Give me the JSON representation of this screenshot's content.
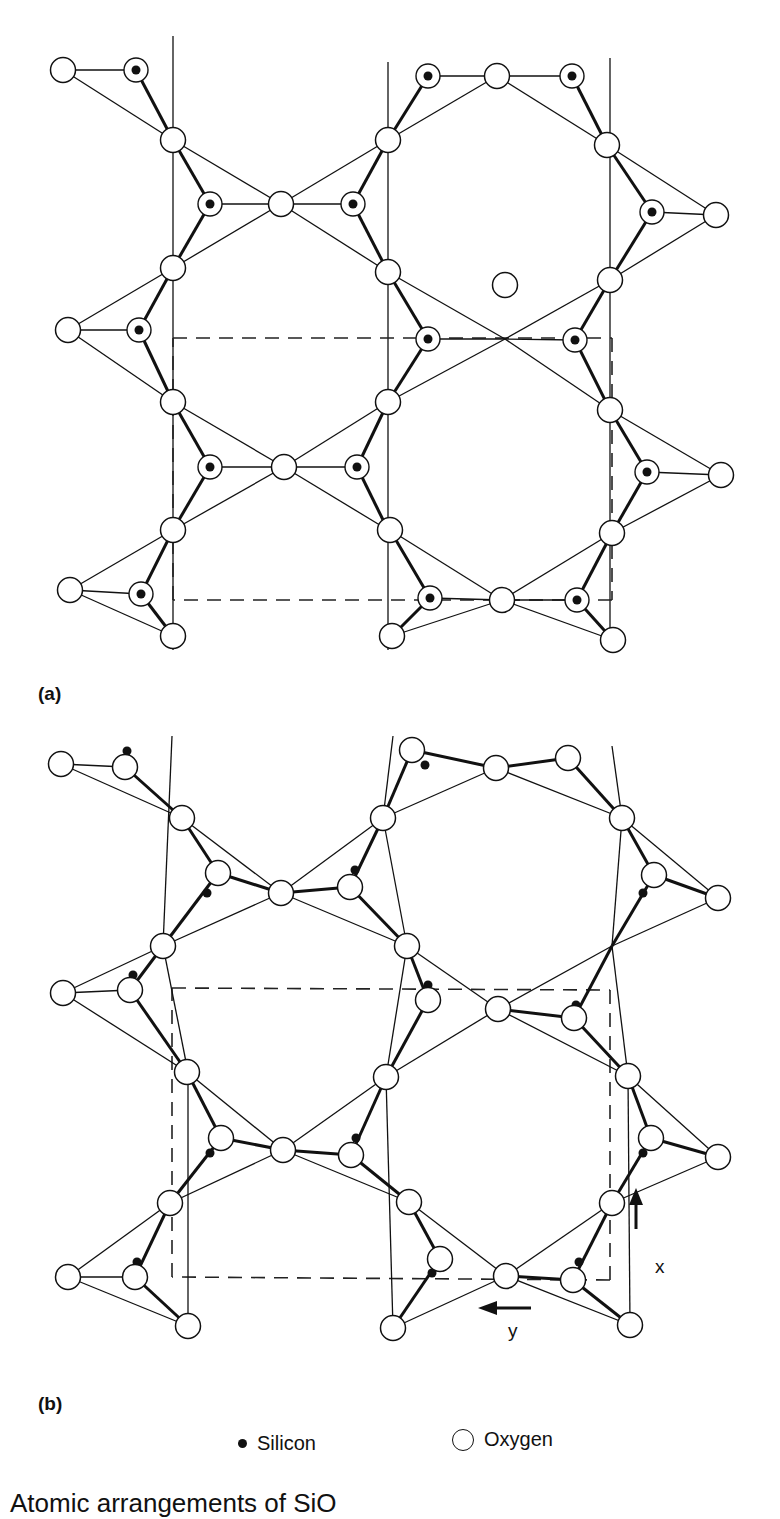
{
  "figure": {
    "panel_a": {
      "label": "(a)",
      "oxygen": [
        [
          63,
          70
        ],
        [
          173,
          140
        ],
        [
          281,
          204
        ],
        [
          173,
          268
        ],
        [
          68,
          330
        ],
        [
          173,
          402
        ],
        [
          284,
          467
        ],
        [
          173,
          530
        ],
        [
          70,
          590
        ],
        [
          173,
          636
        ],
        [
          388,
          140
        ],
        [
          497,
          76
        ],
        [
          607,
          145
        ],
        [
          716,
          215
        ],
        [
          388,
          272
        ],
        [
          505,
          285
        ],
        [
          610,
          280
        ],
        [
          388,
          402
        ],
        [
          610,
          410
        ],
        [
          721,
          475
        ],
        [
          390,
          530
        ],
        [
          502,
          600
        ],
        [
          612,
          533
        ],
        [
          392,
          636
        ],
        [
          613,
          640
        ]
      ],
      "silicon": [
        [
          136,
          70
        ],
        [
          210,
          204
        ],
        [
          353,
          204
        ],
        [
          139,
          330
        ],
        [
          210,
          467
        ],
        [
          357,
          467
        ],
        [
          141,
          594
        ],
        [
          428,
          76
        ],
        [
          572,
          76
        ],
        [
          652,
          212
        ],
        [
          428,
          339
        ],
        [
          575,
          340
        ],
        [
          647,
          472
        ],
        [
          430,
          598
        ],
        [
          577,
          600
        ]
      ],
      "bonds_thin": [
        [
          63,
          70,
          136,
          70
        ],
        [
          63,
          70,
          173,
          140
        ],
        [
          173,
          140,
          281,
          204
        ],
        [
          173,
          268,
          281,
          204
        ],
        [
          281,
          204,
          388,
          140
        ],
        [
          281,
          204,
          388,
          272
        ],
        [
          68,
          330,
          173,
          268
        ],
        [
          68,
          330,
          173,
          402
        ],
        [
          68,
          330,
          139,
          330
        ],
        [
          173,
          402,
          284,
          467
        ],
        [
          173,
          530,
          284,
          467
        ],
        [
          284,
          467,
          388,
          402
        ],
        [
          284,
          467,
          388,
          530
        ],
        [
          70,
          590,
          173,
          530
        ],
        [
          70,
          590,
          173,
          636
        ],
        [
          70,
          590,
          141,
          594
        ],
        [
          388,
          140,
          497,
          76
        ],
        [
          497,
          76,
          607,
          145
        ],
        [
          607,
          145,
          716,
          215
        ],
        [
          716,
          215,
          610,
          280
        ],
        [
          388,
          272,
          505,
          339
        ],
        [
          505,
          339,
          610,
          280
        ],
        [
          388,
          402,
          505,
          339
        ],
        [
          505,
          339,
          610,
          410
        ],
        [
          610,
          410,
          721,
          475
        ],
        [
          721,
          475,
          612,
          533
        ],
        [
          390,
          530,
          502,
          600
        ],
        [
          502,
          600,
          612,
          533
        ],
        [
          392,
          636,
          502,
          600
        ],
        [
          502,
          600,
          613,
          640
        ],
        [
          497,
          76,
          428,
          76
        ],
        [
          497,
          76,
          572,
          76
        ],
        [
          505,
          339,
          428,
          339
        ],
        [
          505,
          339,
          575,
          340
        ],
        [
          502,
          600,
          430,
          598
        ],
        [
          502,
          600,
          577,
          600
        ],
        [
          281,
          204,
          210,
          204
        ],
        [
          281,
          204,
          353,
          204
        ],
        [
          284,
          467,
          210,
          467
        ],
        [
          284,
          467,
          357,
          467
        ],
        [
          716,
          215,
          652,
          212
        ],
        [
          721,
          475,
          647,
          472
        ]
      ],
      "bonds_thick": [
        [
          136,
          70,
          173,
          140
        ],
        [
          210,
          204,
          173,
          140
        ],
        [
          210,
          204,
          173,
          268
        ],
        [
          353,
          204,
          388,
          140
        ],
        [
          353,
          204,
          388,
          272
        ],
        [
          139,
          330,
          173,
          268
        ],
        [
          139,
          330,
          173,
          402
        ],
        [
          210,
          467,
          173,
          402
        ],
        [
          210,
          467,
          173,
          530
        ],
        [
          357,
          467,
          388,
          402
        ],
        [
          357,
          467,
          388,
          530
        ],
        [
          141,
          594,
          173,
          530
        ],
        [
          141,
          594,
          173,
          636
        ],
        [
          428,
          76,
          388,
          140
        ],
        [
          572,
          76,
          607,
          145
        ],
        [
          652,
          212,
          607,
          145
        ],
        [
          652,
          212,
          610,
          280
        ],
        [
          428,
          339,
          388,
          272
        ],
        [
          428,
          339,
          388,
          402
        ],
        [
          575,
          340,
          610,
          280
        ],
        [
          575,
          340,
          610,
          410
        ],
        [
          647,
          472,
          610,
          410
        ],
        [
          647,
          472,
          612,
          533
        ],
        [
          430,
          598,
          390,
          530
        ],
        [
          430,
          598,
          392,
          636
        ],
        [
          577,
          600,
          612,
          533
        ],
        [
          577,
          600,
          613,
          640
        ]
      ],
      "vlines": [
        [
          173,
          36,
          173,
          650
        ],
        [
          388,
          62,
          388,
          650
        ],
        [
          610,
          58,
          610,
          650
        ]
      ],
      "cell_dashed": [
        [
          173,
          338,
          612,
          338
        ],
        [
          612,
          338,
          612,
          600
        ],
        [
          612,
          600,
          173,
          600
        ],
        [
          173,
          600,
          173,
          338
        ]
      ]
    },
    "panel_b": {
      "label": "(b)",
      "oxygen": [
        [
          61,
          764
        ],
        [
          125,
          767
        ],
        [
          182,
          818
        ],
        [
          218,
          873
        ],
        [
          281,
          893
        ],
        [
          350,
          887
        ],
        [
          163,
          946
        ],
        [
          130,
          990
        ],
        [
          63,
          993
        ],
        [
          187,
          1072
        ],
        [
          221,
          1138
        ],
        [
          283,
          1150
        ],
        [
          351,
          1155
        ],
        [
          170,
          1203
        ],
        [
          135,
          1277
        ],
        [
          68,
          1277
        ],
        [
          188,
          1326
        ],
        [
          412,
          750
        ],
        [
          496,
          768
        ],
        [
          568,
          758
        ],
        [
          622,
          818
        ],
        [
          654,
          875
        ],
        [
          718,
          898
        ],
        [
          383,
          818
        ],
        [
          407,
          946
        ],
        [
          428,
          1000
        ],
        [
          498,
          1009
        ],
        [
          574,
          1018
        ],
        [
          628,
          1076
        ],
        [
          651,
          1138
        ],
        [
          718,
          1157
        ],
        [
          386,
          1077
        ],
        [
          409,
          1202
        ],
        [
          440,
          1259
        ],
        [
          506,
          1276
        ],
        [
          573,
          1280
        ],
        [
          612,
          1203
        ],
        [
          630,
          1325
        ],
        [
          393,
          1328
        ]
      ],
      "silicon": [
        [
          127,
          751
        ],
        [
          207,
          893
        ],
        [
          355,
          870
        ],
        [
          425,
          765
        ],
        [
          568,
          750
        ],
        [
          643,
          893
        ],
        [
          133,
          975
        ],
        [
          210,
          1153
        ],
        [
          356,
          1138
        ],
        [
          428,
          985
        ],
        [
          576,
          1005
        ],
        [
          643,
          1153
        ],
        [
          137,
          1262
        ],
        [
          432,
          1273
        ],
        [
          579,
          1262
        ]
      ],
      "bonds_thin": [
        [
          61,
          764,
          125,
          767
        ],
        [
          61,
          764,
          182,
          818
        ],
        [
          182,
          818,
          281,
          893
        ],
        [
          163,
          946,
          281,
          893
        ],
        [
          281,
          893,
          383,
          818
        ],
        [
          281,
          893,
          407,
          946
        ],
        [
          63,
          993,
          130,
          990
        ],
        [
          63,
          993,
          163,
          946
        ],
        [
          63,
          993,
          187,
          1072
        ],
        [
          187,
          1072,
          283,
          1150
        ],
        [
          170,
          1203,
          283,
          1150
        ],
        [
          283,
          1150,
          386,
          1077
        ],
        [
          283,
          1150,
          409,
          1202
        ],
        [
          68,
          1277,
          135,
          1277
        ],
        [
          68,
          1277,
          170,
          1203
        ],
        [
          68,
          1277,
          188,
          1326
        ],
        [
          383,
          818,
          496,
          768
        ],
        [
          496,
          768,
          622,
          818
        ],
        [
          622,
          818,
          718,
          898
        ],
        [
          718,
          898,
          612,
          946
        ],
        [
          407,
          946,
          498,
          1009
        ],
        [
          612,
          946,
          498,
          1009
        ],
        [
          386,
          1077,
          498,
          1009
        ],
        [
          498,
          1009,
          628,
          1076
        ],
        [
          628,
          1076,
          718,
          1157
        ],
        [
          718,
          1157,
          612,
          1203
        ],
        [
          409,
          1202,
          506,
          1276
        ],
        [
          612,
          1203,
          506,
          1276
        ],
        [
          393,
          1328,
          506,
          1276
        ],
        [
          506,
          1276,
          630,
          1325
        ],
        [
          172,
          736,
          163,
          946
        ],
        [
          163,
          946,
          188,
          1072
        ],
        [
          188,
          1072,
          188,
          1326
        ],
        [
          393,
          736,
          383,
          818
        ],
        [
          383,
          818,
          407,
          946
        ],
        [
          407,
          946,
          386,
          1077
        ],
        [
          386,
          1077,
          393,
          1328
        ],
        [
          612,
          746,
          622,
          818
        ],
        [
          622,
          818,
          612,
          946
        ],
        [
          612,
          946,
          628,
          1076
        ],
        [
          628,
          1076,
          630,
          1325
        ]
      ],
      "bonds_thick": [
        [
          125,
          767,
          182,
          818
        ],
        [
          218,
          873,
          182,
          818
        ],
        [
          218,
          873,
          163,
          946
        ],
        [
          218,
          873,
          281,
          893
        ],
        [
          350,
          887,
          383,
          818
        ],
        [
          350,
          887,
          407,
          946
        ],
        [
          350,
          887,
          281,
          893
        ],
        [
          130,
          990,
          163,
          946
        ],
        [
          130,
          990,
          187,
          1072
        ],
        [
          221,
          1138,
          187,
          1072
        ],
        [
          221,
          1138,
          170,
          1203
        ],
        [
          221,
          1138,
          283,
          1150
        ],
        [
          351,
          1155,
          386,
          1077
        ],
        [
          351,
          1155,
          409,
          1202
        ],
        [
          351,
          1155,
          283,
          1150
        ],
        [
          135,
          1277,
          170,
          1203
        ],
        [
          135,
          1277,
          188,
          1326
        ],
        [
          412,
          750,
          383,
          818
        ],
        [
          412,
          750,
          496,
          768
        ],
        [
          568,
          758,
          622,
          818
        ],
        [
          568,
          758,
          496,
          768
        ],
        [
          654,
          875,
          622,
          818
        ],
        [
          654,
          875,
          612,
          946
        ],
        [
          654,
          875,
          718,
          898
        ],
        [
          428,
          1000,
          407,
          946
        ],
        [
          428,
          1000,
          386,
          1077
        ],
        [
          574,
          1018,
          612,
          946
        ],
        [
          574,
          1018,
          628,
          1076
        ],
        [
          574,
          1018,
          498,
          1009
        ],
        [
          651,
          1138,
          628,
          1076
        ],
        [
          651,
          1138,
          612,
          1203
        ],
        [
          651,
          1138,
          718,
          1157
        ],
        [
          440,
          1259,
          409,
          1202
        ],
        [
          440,
          1259,
          393,
          1328
        ],
        [
          573,
          1280,
          612,
          1203
        ],
        [
          573,
          1280,
          630,
          1325
        ],
        [
          573,
          1280,
          506,
          1276
        ]
      ],
      "cell_dashed": [
        [
          172,
          988,
          610,
          990
        ],
        [
          610,
          990,
          610,
          1280
        ],
        [
          610,
          1280,
          172,
          1277
        ],
        [
          172,
          1277,
          172,
          988
        ]
      ]
    },
    "axes": {
      "x_label": "x",
      "y_label": "y"
    }
  },
  "legend": {
    "silicon_label": "Silicon",
    "oxygen_label": "Oxygen"
  },
  "caption": "Atomic arrangements of SiO"
}
